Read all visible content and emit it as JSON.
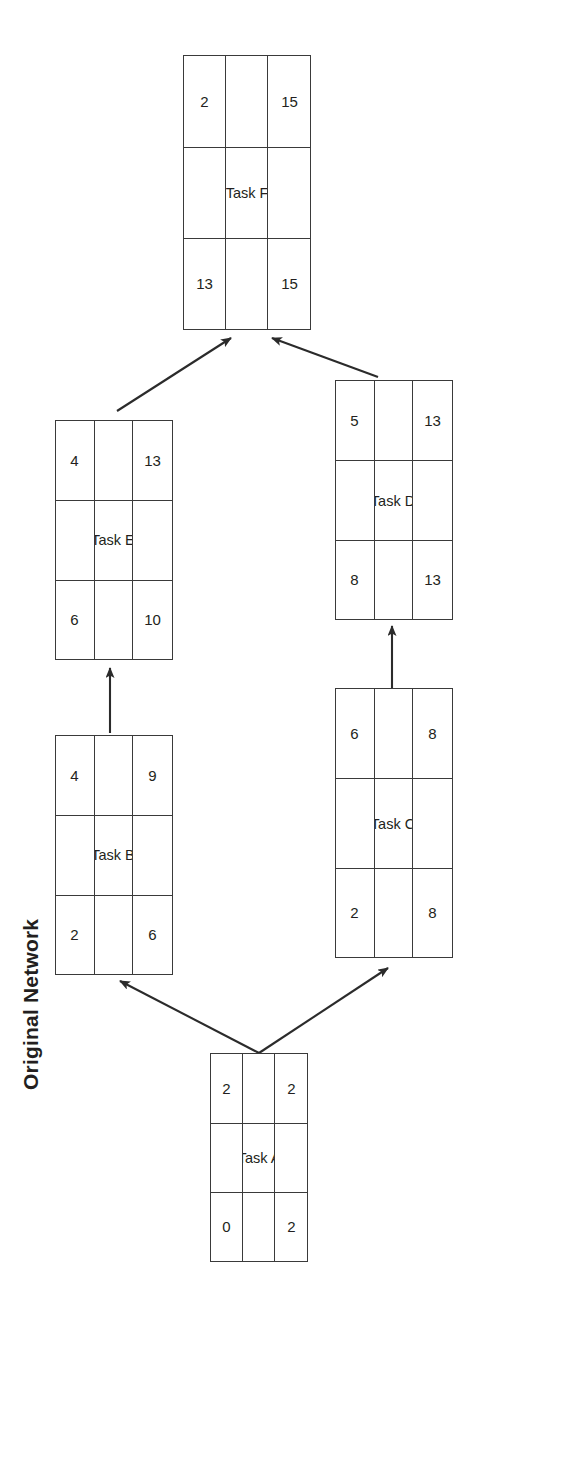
{
  "diagram": {
    "title": "Original Network",
    "orientation_note": "page rotated 90 degrees counter-clockwise",
    "line_color": "#3a3a3a",
    "text_color": "#231f20",
    "background": "#ffffff"
  },
  "legend": {
    "cell_roles": [
      "early-start",
      "duration",
      "early-finish",
      "",
      "task-name",
      "",
      "late-start",
      "slack",
      "late-finish"
    ]
  },
  "nodes": [
    {
      "id": "task-a",
      "name": "Task A",
      "early_start": "0",
      "duration": "2",
      "early_finish": "2",
      "late_start": "0",
      "slack": "0",
      "late_finish": "2"
    },
    {
      "id": "task-b",
      "name": "Task B",
      "early_start": "2",
      "duration": "4",
      "early_finish": "6",
      "late_start": "5",
      "slack": "3",
      "late_finish": "9"
    },
    {
      "id": "task-c",
      "name": "Task C",
      "early_start": "2",
      "duration": "6",
      "early_finish": "8",
      "late_start": "2",
      "slack": "0",
      "late_finish": "8"
    },
    {
      "id": "task-d",
      "name": "Task D",
      "early_start": "8",
      "duration": "5",
      "early_finish": "13",
      "late_start": "8",
      "slack": "0",
      "late_finish": "13"
    },
    {
      "id": "task-e",
      "name": "Task E",
      "early_start": "6",
      "duration": "4",
      "early_finish": "10",
      "late_start": "9",
      "slack": "3",
      "late_finish": "13"
    },
    {
      "id": "task-f",
      "name": "Task F",
      "early_start": "13",
      "duration": "2",
      "early_finish": "15",
      "late_start": "13",
      "slack": "0",
      "late_finish": "15"
    }
  ],
  "edges": [
    {
      "id": "edge-a-b",
      "from": "task-a",
      "to": "task-b"
    },
    {
      "id": "edge-a-c",
      "from": "task-a",
      "to": "task-c"
    },
    {
      "id": "edge-b-e",
      "from": "task-b",
      "to": "task-e"
    },
    {
      "id": "edge-c-d",
      "from": "task-c",
      "to": "task-d"
    },
    {
      "id": "edge-e-f",
      "from": "task-e",
      "to": "task-f"
    },
    {
      "id": "edge-d-f",
      "from": "task-d",
      "to": "task-f"
    }
  ]
}
